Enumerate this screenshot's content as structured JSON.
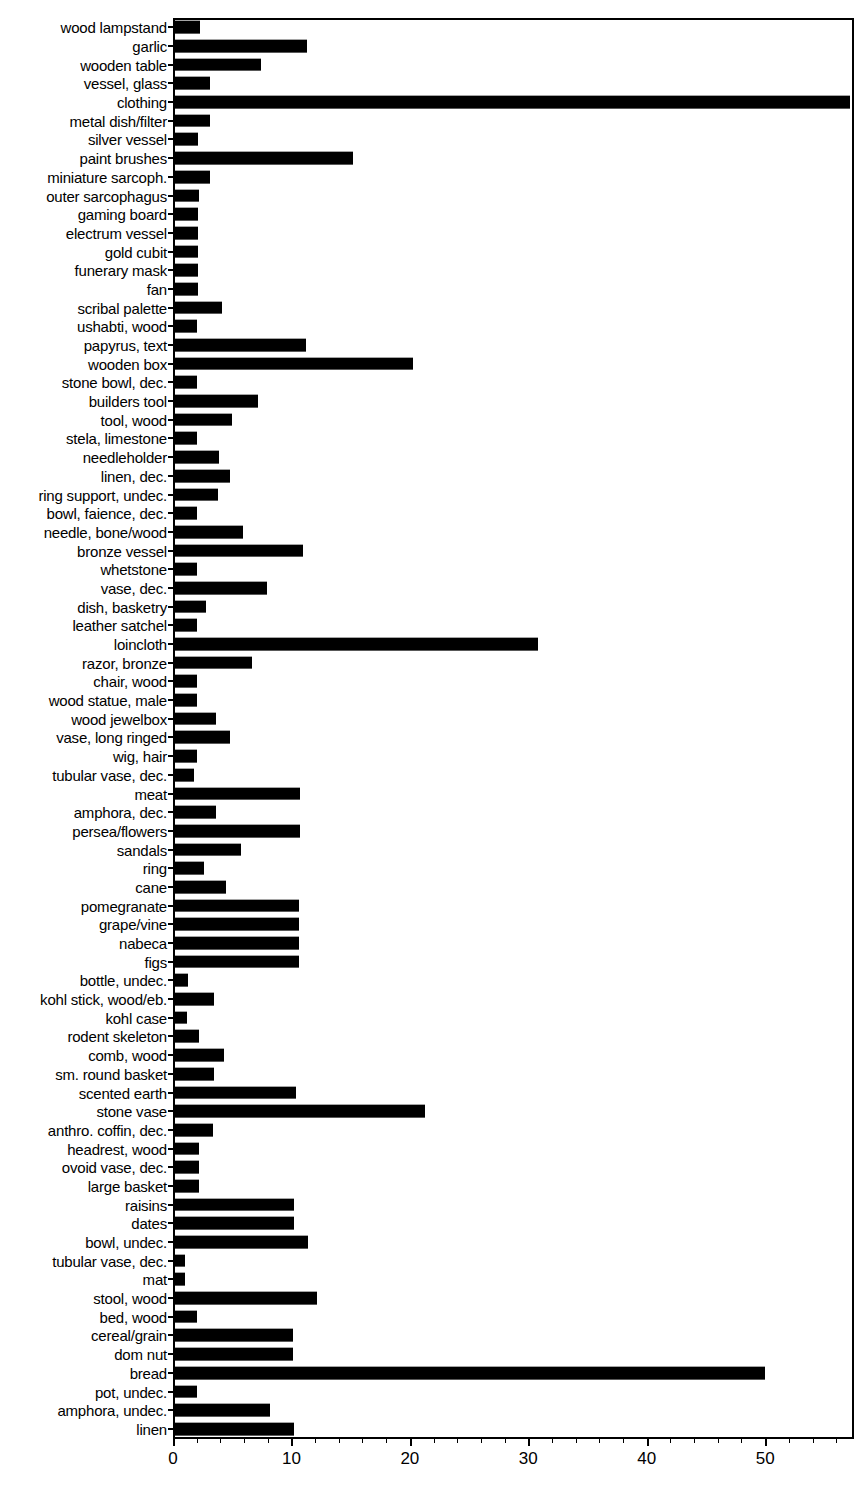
{
  "chart_data": {
    "type": "bar",
    "orientation": "horizontal",
    "title": "",
    "subtitle": "",
    "xlabel": "",
    "ylabel": "",
    "xlim": [
      0,
      57.5
    ],
    "grid": false,
    "legend": null,
    "axis_color": "#000000",
    "bar_color": "#000000",
    "background_color": "#ffffff",
    "xticks": [
      0,
      10,
      20,
      30,
      40,
      50
    ],
    "xtick_labels": [
      "0",
      "10",
      "20",
      "30",
      "40",
      "50"
    ],
    "minor_tick_interval": 2,
    "categories": [
      "wood lampstand",
      "garlic",
      "wooden table",
      "vessel, glass",
      "clothing",
      "metal dish/filter",
      "silver vessel",
      "paint brushes",
      "miniature sarcoph.",
      "outer sarcophagus",
      "gaming board",
      "electrum vessel",
      "gold cubit",
      "funerary mask",
      "fan",
      "scribal palette",
      "ushabti, wood",
      "papyrus, text",
      "wooden box",
      "stone bowl, dec.",
      "builders tool",
      "tool, wood",
      "stela, limestone",
      "needleholder",
      "linen, dec.",
      "ring support, undec.",
      "bowl, faience, dec.",
      "needle, bone/wood",
      "bronze vessel",
      "whetstone",
      "vase, dec.",
      "dish, basketry",
      "leather satchel",
      "loincloth",
      "razor, bronze",
      "chair, wood",
      "wood statue, male",
      "wood jewelbox",
      "vase, long ringed",
      "wig, hair",
      "tubular vase, dec.",
      "meat",
      "amphora, dec.",
      "persea/flowers",
      "sandals",
      "ring",
      "cane",
      "pomegranate",
      "grape/vine",
      "nabeca",
      "figs",
      "bottle, undec.",
      "kohl stick, wood/eb.",
      "kohl case",
      "rodent skeleton",
      "comb, wood",
      "sm. round basket",
      "scented earth",
      "stone vase",
      "anthro. coffin, dec.",
      "headrest, wood",
      "ovoid vase, dec.",
      "large basket",
      "raisins",
      "dates",
      "bowl, undec.",
      "tubular vase, dec.",
      "mat",
      "stool, wood",
      "bed, wood",
      "cereal/grain",
      "dom nut",
      "bread",
      "pot, undec.",
      "amphora, undec.",
      "linen"
    ],
    "values": [
      2.3,
      11.3,
      7.4,
      3.1,
      57.2,
      3.1,
      2.1,
      15.2,
      3.1,
      2.2,
      2.1,
      2.1,
      2.1,
      2.1,
      2.1,
      4.1,
      2.0,
      11.2,
      20.3,
      2.0,
      7.2,
      5.0,
      2.0,
      3.9,
      4.8,
      3.8,
      2.0,
      5.9,
      11.0,
      2.0,
      7.9,
      2.8,
      2.0,
      30.8,
      6.7,
      2.0,
      2.0,
      3.6,
      4.8,
      2.0,
      1.8,
      10.7,
      3.6,
      10.7,
      5.7,
      2.6,
      4.5,
      10.6,
      10.6,
      10.6,
      10.6,
      1.3,
      3.5,
      1.2,
      2.2,
      4.3,
      3.5,
      10.4,
      21.3,
      3.4,
      2.2,
      2.2,
      2.2,
      10.2,
      10.2,
      11.4,
      1.0,
      1.0,
      12.2,
      2.0,
      10.1,
      10.1,
      50.0,
      2.0,
      8.2,
      10.2
    ]
  }
}
